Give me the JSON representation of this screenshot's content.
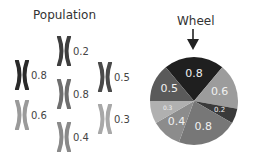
{
  "population": {
    "title": "Population",
    "individuals": [
      {
        "fitness": "0.8",
        "color": "#2a2a2a",
        "x": 14,
        "y": 60
      },
      {
        "fitness": "0.6",
        "color": "#9a9a9a",
        "x": 14,
        "y": 100
      },
      {
        "fitness": "0.2",
        "color": "#3e3e3e",
        "x": 56,
        "y": 36
      },
      {
        "fitness": "0.8",
        "color": "#6e6e6e",
        "x": 56,
        "y": 79
      },
      {
        "fitness": "0.4",
        "color": "#8a8a8a",
        "x": 56,
        "y": 122
      },
      {
        "fitness": "0.5",
        "color": "#4a4a4a",
        "x": 97,
        "y": 62
      },
      {
        "fitness": "0.3",
        "color": "#a8a8a8",
        "x": 97,
        "y": 104
      }
    ]
  },
  "wheel": {
    "title": "Wheel",
    "pointer": "down-arrow",
    "start_angle_deg": -40
  },
  "chart_data": {
    "type": "pie",
    "title": "Wheel",
    "categories": [
      "0.8",
      "0.6",
      "0.2",
      "0.8",
      "0.4",
      "0.3",
      "0.5"
    ],
    "values": [
      0.8,
      0.6,
      0.2,
      0.8,
      0.4,
      0.3,
      0.5
    ],
    "colors": [
      "#1f1f1f",
      "#9c9c9c",
      "#3a3a3a",
      "#777777",
      "#8c8c8c",
      "#b0b0b0",
      "#5a5a5a"
    ],
    "label_sizes": [
      11,
      11,
      7,
      11,
      11,
      6,
      11
    ],
    "legend": "none",
    "annotations": [
      "pointer arrow at top of wheel"
    ]
  }
}
